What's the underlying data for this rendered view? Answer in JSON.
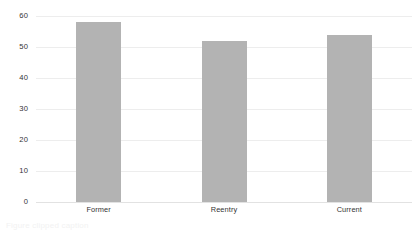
{
  "chart_data": {
    "type": "bar",
    "title": "",
    "subtitle": "",
    "xlabel": "",
    "ylabel": "",
    "categories": [
      "Former",
      "Reentry",
      "Current"
    ],
    "values": [
      58,
      52,
      54
    ],
    "series": [
      {
        "name": "value",
        "values": [
          58,
          52,
          54
        ]
      }
    ],
    "ylim": [
      0,
      60
    ],
    "ytick_labels": [
      "0",
      "10",
      "20",
      "30",
      "40",
      "50",
      "60"
    ],
    "ytick_values": [
      0,
      10,
      20,
      30,
      40,
      50,
      60
    ],
    "grid": "horizontal",
    "legend": "none",
    "bar_color": "#b3b3b3",
    "gridline_color": "#ededed",
    "axis_color": "#e2e2e2",
    "label_color": "#333333",
    "background_color": "#ffffff",
    "annotations": []
  },
  "caption": {
    "clipped_text": "Figure   clipped caption"
  }
}
